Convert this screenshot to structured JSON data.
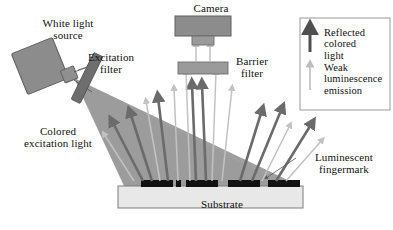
{
  "figure": {
    "type": "optical-luminescence-imaging-schematic",
    "title_visible": false
  },
  "labels": {
    "white_light_source": "White light\nsource",
    "excitation_filter": "Excitation\nfilter",
    "colored_excitation_light": "Colored\nexcitation light",
    "camera": "Camera",
    "barrier_filter": "Barrier\nfilter",
    "substrate": "Substrate",
    "luminescent_fingermark": "Luminescent\nfingermark"
  },
  "legend": {
    "items": [
      {
        "label": "Reflected\ncolored\nlight",
        "arrow": "thick-dark-arrow"
      },
      {
        "label": "Weak\nluminescence\nemission",
        "arrow": "thin-light-arrow"
      }
    ]
  },
  "colors": {
    "lamp_box": "#8c8c8c",
    "lamp_box_stroke": "#5f5f5f",
    "excitation_filter_bar": "#6e6e6e",
    "excitation_cone": "#9c9c9c",
    "camera_body": "#8c8c8c",
    "camera_lens": "#9a9a9a",
    "barrier_filter_bar": "#9a9a9a",
    "substrate_fill": "#e8e8e8",
    "substrate_stroke": "#7d7d7d",
    "fingermark": "#111111",
    "reflected_arrow": "#6b6b6b",
    "luminescence_arrow": "#c2c2c2",
    "legend_border": "#9a9a9a",
    "text": "#111111"
  },
  "components": {
    "camera": {
      "body_w": 56,
      "body_h": 20,
      "lens_w": 22,
      "lens_h": 11
    },
    "barrier_filter": {
      "w": 50,
      "h": 12
    },
    "substrate": {
      "w": 185,
      "h": 22
    },
    "fingermark_count": 5
  }
}
